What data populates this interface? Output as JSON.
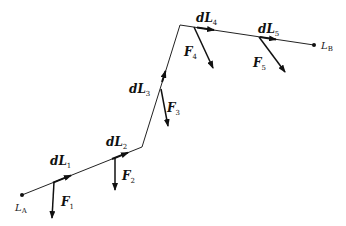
{
  "diagram": {
    "colors": {
      "line": "#222222",
      "background": "#ffffff"
    },
    "endpoints": [
      {
        "id": "LA",
        "label": "L",
        "sub": "A",
        "x": 22,
        "y": 195
      },
      {
        "id": "LB",
        "label": "L",
        "sub": "B",
        "x": 314,
        "y": 45
      }
    ],
    "segments": [
      {
        "id": "dL1",
        "label": "dL",
        "sub": "1"
      },
      {
        "id": "dL2",
        "label": "dL",
        "sub": "2"
      },
      {
        "id": "dL3",
        "label": "dL",
        "sub": "3"
      },
      {
        "id": "dL4",
        "label": "dL",
        "sub": "4"
      },
      {
        "id": "dL5",
        "label": "dL",
        "sub": "5"
      }
    ],
    "forces": [
      {
        "id": "F1",
        "label": "F",
        "sub": "1"
      },
      {
        "id": "F2",
        "label": "F",
        "sub": "2"
      },
      {
        "id": "F3",
        "label": "F",
        "sub": "3"
      },
      {
        "id": "F4",
        "label": "F",
        "sub": "4"
      },
      {
        "id": "F5",
        "label": "F",
        "sub": "5"
      }
    ]
  }
}
